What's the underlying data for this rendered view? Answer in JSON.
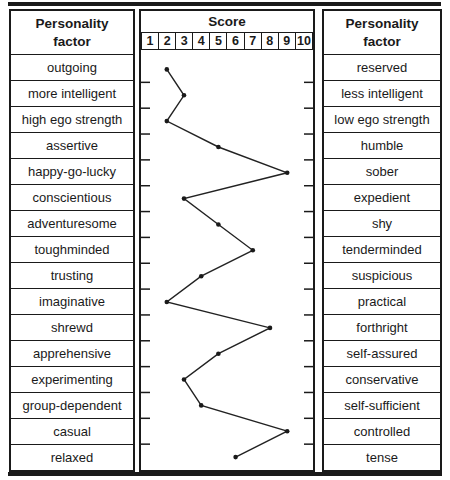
{
  "figure": {
    "left_table": {
      "header": "Personality\nfactor"
    },
    "right_table": {
      "header": "Personality\nfactor"
    },
    "score_table": {
      "header": "Score",
      "scale": [
        "1",
        "2",
        "3",
        "4",
        "5",
        "6",
        "7",
        "8",
        "9",
        "10"
      ]
    },
    "rows": [
      {
        "left": "outgoing",
        "right": "reserved",
        "score": 2
      },
      {
        "left": "more intelligent",
        "right": "less intelligent",
        "score": 3
      },
      {
        "left": "high ego strength",
        "right": "low ego strength",
        "score": 2
      },
      {
        "left": "assertive",
        "right": "humble",
        "score": 5
      },
      {
        "left": "happy-go-lucky",
        "right": "sober",
        "score": 9
      },
      {
        "left": "conscientious",
        "right": "expedient",
        "score": 3
      },
      {
        "left": "adventuresome",
        "right": "shy",
        "score": 5
      },
      {
        "left": "toughminded",
        "right": "tenderminded",
        "score": 7
      },
      {
        "left": "trusting",
        "right": "suspicious",
        "score": 4
      },
      {
        "left": "imaginative",
        "right": "practical",
        "score": 2
      },
      {
        "left": "shrewd",
        "right": "forthright",
        "score": 8
      },
      {
        "left": "apprehensive",
        "right": "self-assured",
        "score": 5
      },
      {
        "left": "experimenting",
        "right": "conservative",
        "score": 3
      },
      {
        "left": "group-dependent",
        "right": "self-sufficient",
        "score": 4
      },
      {
        "left": "casual",
        "right": "controlled",
        "score": 9
      },
      {
        "left": "relaxed",
        "right": "tense",
        "score": 6
      }
    ]
  },
  "colors": {
    "ink": "#1a1a1a",
    "line": "#222222",
    "background": "#ffffff"
  },
  "chart_data": {
    "type": "line",
    "title": "Score",
    "orientation": "vertical-profile",
    "x_scale": [
      1,
      2,
      3,
      4,
      5,
      6,
      7,
      8,
      9,
      10
    ],
    "xlim": [
      1,
      10
    ],
    "categories_left": [
      "outgoing",
      "more intelligent",
      "high ego strength",
      "assertive",
      "happy-go-lucky",
      "conscientious",
      "adventuresome",
      "toughminded",
      "trusting",
      "imaginative",
      "shrewd",
      "apprehensive",
      "experimenting",
      "group-dependent",
      "casual",
      "relaxed"
    ],
    "categories_right": [
      "reserved",
      "less intelligent",
      "low ego strength",
      "humble",
      "sober",
      "expedient",
      "shy",
      "tenderminded",
      "suspicious",
      "practical",
      "forthright",
      "self-assured",
      "conservative",
      "self-sufficient",
      "controlled",
      "tense"
    ],
    "values": [
      2,
      3,
      2,
      5,
      9,
      3,
      5,
      7,
      4,
      2,
      8,
      5,
      3,
      4,
      9,
      6
    ],
    "grid": "row-ticks-on-column-edges",
    "legend": "none"
  }
}
